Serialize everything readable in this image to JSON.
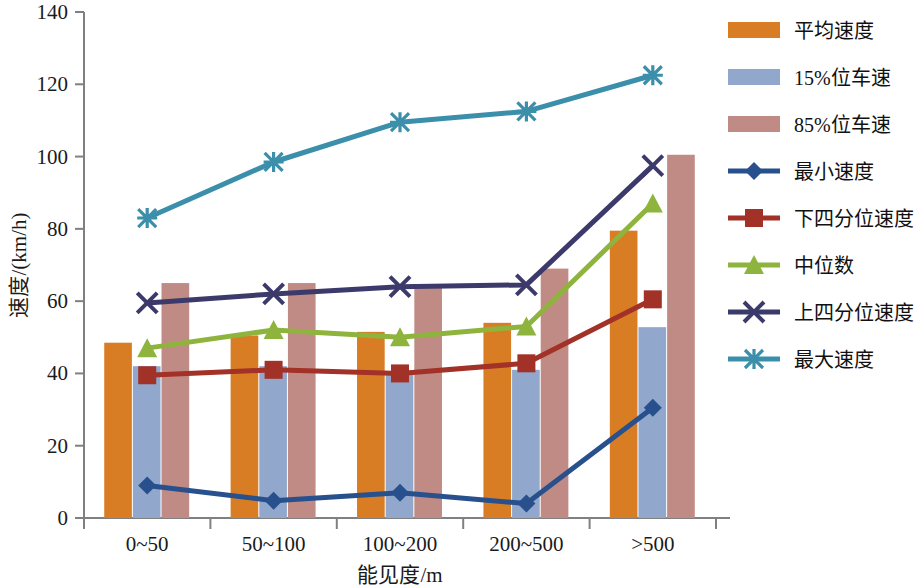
{
  "chart_data": {
    "type": "bar",
    "title": "",
    "xlabel": "能见度/m",
    "ylabel": "速度/(km/h)",
    "categories": [
      "0~50",
      "50~100",
      "100~200",
      "200~500",
      ">500"
    ],
    "ylim": [
      0,
      140
    ],
    "ytick_step": 20,
    "yticks": [
      "0",
      "20",
      "40",
      "60",
      "80",
      "100",
      "120",
      "140"
    ],
    "grid": false,
    "legend_position": "right",
    "bar_series": [
      {
        "name": "平均速度",
        "kind": "bar",
        "color": "#d97d25",
        "values": [
          48.5,
          50.5,
          51.5,
          54.0,
          79.5
        ]
      },
      {
        "name": "15%位车速",
        "kind": "bar",
        "color": "#92a7cc",
        "values": [
          42.0,
          42.0,
          40.5,
          41.0,
          52.8
        ]
      },
      {
        "name": "85%位车速",
        "kind": "bar",
        "color": "#c08b84",
        "values": [
          65.0,
          65.0,
          64.5,
          69.0,
          100.5
        ]
      }
    ],
    "line_series": [
      {
        "name": "最小速度",
        "kind": "line",
        "color": "#27508d",
        "marker": "diamond",
        "values": [
          9.0,
          4.8,
          7.0,
          4.0,
          30.5
        ]
      },
      {
        "name": "下四分位速度",
        "kind": "line",
        "color": "#a23127",
        "marker": "square",
        "values": [
          39.5,
          41.0,
          40.0,
          42.8,
          60.5
        ]
      },
      {
        "name": "中位数",
        "kind": "line",
        "color": "#8eb43e",
        "marker": "triangle",
        "values": [
          47.0,
          52.0,
          50.0,
          53.0,
          87.0
        ]
      },
      {
        "name": "上四分位速度",
        "kind": "line",
        "color": "#3b3a6b",
        "marker": "x",
        "values": [
          59.5,
          62.0,
          64.0,
          64.5,
          97.5
        ]
      },
      {
        "name": "最大速度",
        "kind": "line",
        "color": "#3c8fab",
        "marker": "asterisk",
        "values": [
          83.0,
          98.5,
          109.5,
          112.5,
          122.5
        ]
      }
    ]
  },
  "legend": {
    "items": [
      {
        "label": "平均速度",
        "type": "bar",
        "color": "#d97d25"
      },
      {
        "label": "15%位车速",
        "type": "bar",
        "color": "#92a7cc"
      },
      {
        "label": "85%位车速",
        "type": "bar",
        "color": "#c08b84"
      },
      {
        "label": "最小速度",
        "type": "line",
        "color": "#27508d",
        "marker": "diamond"
      },
      {
        "label": "下四分位速度",
        "type": "line",
        "color": "#a23127",
        "marker": "square"
      },
      {
        "label": "中位数",
        "type": "line",
        "color": "#8eb43e",
        "marker": "triangle"
      },
      {
        "label": "上四分位速度",
        "type": "line",
        "color": "#3b3a6b",
        "marker": "x"
      },
      {
        "label": "最大速度",
        "type": "line",
        "color": "#3c8fab",
        "marker": "asterisk"
      }
    ]
  },
  "axes": {
    "axis_color": "#808080",
    "y_axis_title": "速度/(km/h)",
    "x_axis_title": "能见度/m"
  }
}
